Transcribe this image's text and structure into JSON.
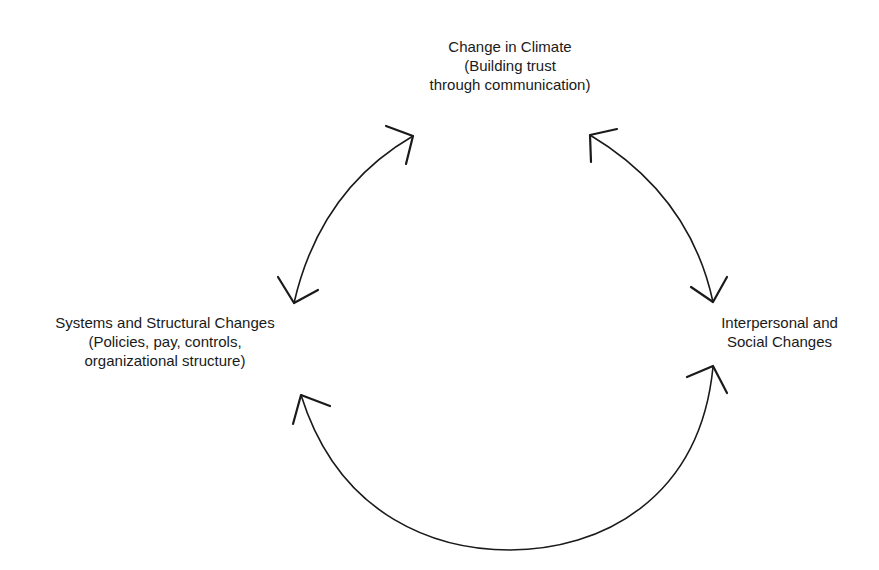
{
  "diagram": {
    "type": "cycle",
    "nodes": [
      {
        "id": "top",
        "lines": [
          "Change in Climate",
          "(Building trust",
          "through communication)"
        ]
      },
      {
        "id": "left",
        "lines": [
          "Systems and Structural Changes",
          "(Policies, pay, controls,",
          "organizational structure)"
        ]
      },
      {
        "id": "right",
        "lines": [
          "Interpersonal and",
          "Social Changes"
        ]
      }
    ],
    "edges": [
      {
        "from": "top",
        "to": "left",
        "direction": "bidirectional"
      },
      {
        "from": "top",
        "to": "right",
        "direction": "bidirectional"
      },
      {
        "from": "left",
        "to": "right",
        "direction": "bidirectional"
      }
    ]
  }
}
